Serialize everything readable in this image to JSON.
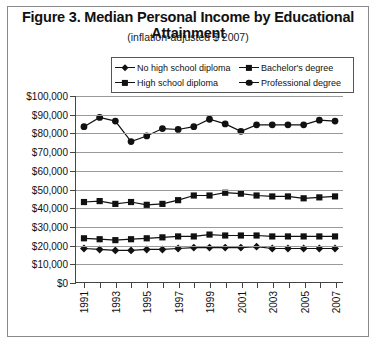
{
  "figure": {
    "title": "Figure 3. Median Personal Income by Educational Attainment",
    "subtitle": "(inflation-adjusted $ 2007)"
  },
  "legend": {
    "position": "top-center",
    "items": [
      {
        "label": "No high school diploma",
        "marker": "diamond",
        "color": "#111111"
      },
      {
        "label": "Bachelor's degree",
        "marker": "square",
        "color": "#111111"
      },
      {
        "label": "High school diploma",
        "marker": "square",
        "color": "#111111"
      },
      {
        "label": "Professional degree",
        "marker": "circle",
        "color": "#111111"
      }
    ]
  },
  "axes": {
    "y_ticks": [
      "$0",
      "$10,000",
      "$20,000",
      "$30,000",
      "$40,000",
      "$50,000",
      "$60,000",
      "$70,000",
      "$80,000",
      "$90,000",
      "$100,000"
    ],
    "x_ticks": [
      "1991",
      "1993",
      "1995",
      "1997",
      "1999",
      "2001",
      "2003",
      "2005",
      "2007"
    ]
  },
  "chart_data": {
    "type": "line",
    "title": "Figure 3. Median Personal Income by Educational Attainment",
    "subtitle": "(inflation-adjusted $ 2007)",
    "xlabel": "",
    "ylabel": "",
    "xlim": [
      1991,
      2007
    ],
    "ylim": [
      0,
      100000
    ],
    "ytick_step": 10000,
    "grid": true,
    "legend_position": "top-center",
    "x": [
      1991,
      1992,
      1993,
      1994,
      1995,
      1996,
      1997,
      1998,
      1999,
      2000,
      2001,
      2002,
      2003,
      2004,
      2005,
      2006,
      2007
    ],
    "series": [
      {
        "name": "Professional degree",
        "marker": "circle",
        "color": "#111111",
        "values": [
          83500,
          88500,
          86500,
          75500,
          78500,
          82500,
          82000,
          83500,
          87500,
          85000,
          81000,
          84500,
          84500,
          84500,
          84500,
          87000,
          86500
        ]
      },
      {
        "name": "Bachelor's degree",
        "marker": "square",
        "color": "#111111",
        "values": [
          43000,
          43500,
          42000,
          43000,
          41500,
          42000,
          44000,
          46500,
          46500,
          48000,
          47500,
          46500,
          46000,
          46000,
          45000,
          45500,
          46000
        ]
      },
      {
        "name": "High school diploma",
        "marker": "square",
        "color": "#111111",
        "values": [
          23500,
          23000,
          22500,
          23000,
          23500,
          24000,
          24500,
          24500,
          25500,
          25000,
          25000,
          25000,
          24500,
          24500,
          24500,
          24500,
          24500
        ]
      },
      {
        "name": "No high school diploma",
        "marker": "diamond",
        "color": "#111111",
        "values": [
          18000,
          17500,
          17000,
          17000,
          17500,
          17500,
          18000,
          18500,
          18500,
          18500,
          18500,
          19000,
          18000,
          18000,
          18000,
          18000,
          18000
        ]
      }
    ]
  }
}
